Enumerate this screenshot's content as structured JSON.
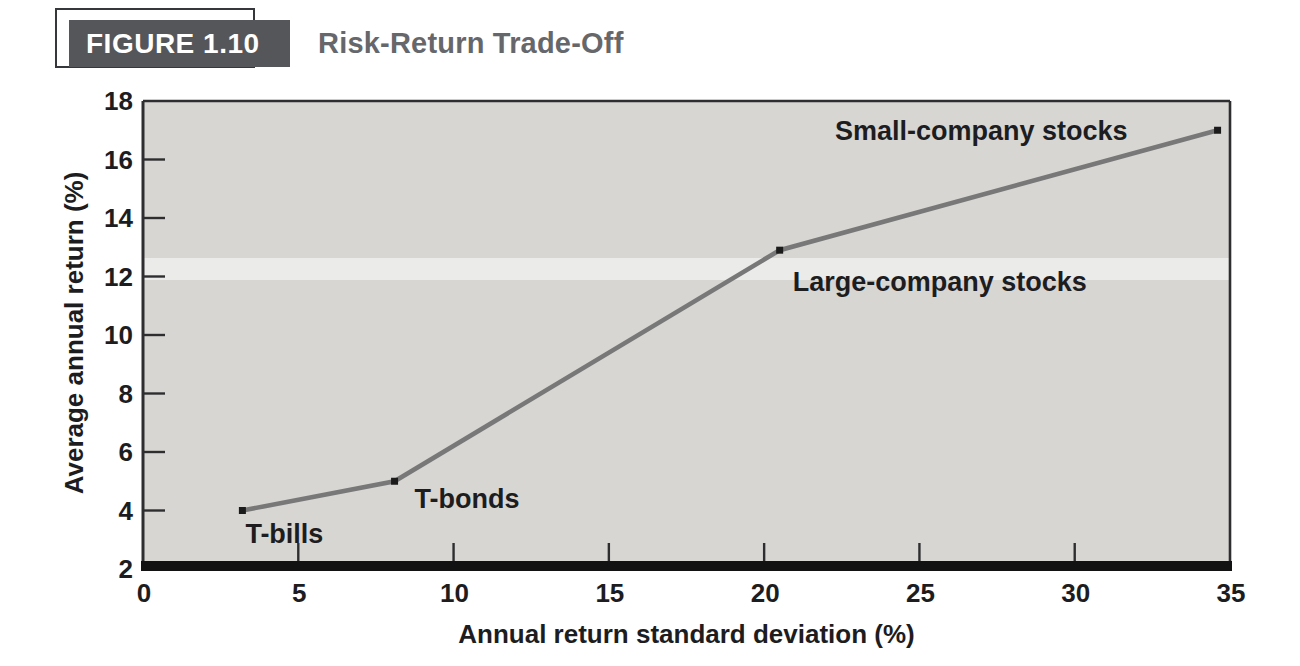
{
  "header": {
    "figure_label": "FIGURE 1.10",
    "title": "Risk-Return Trade-Off"
  },
  "chart_data": {
    "type": "line",
    "title": "Risk-Return Trade-Off",
    "xlabel": "Annual return standard deviation (%)",
    "ylabel": "Average annual return (%)",
    "xlim": [
      0,
      35
    ],
    "ylim": [
      2,
      18
    ],
    "x_ticks": [
      0,
      5,
      10,
      15,
      20,
      25,
      30,
      35
    ],
    "y_ticks": [
      2,
      4,
      6,
      8,
      10,
      12,
      14,
      16,
      18
    ],
    "grid": false,
    "legend": "none",
    "series": [
      {
        "name": "risk-return-tradeoff",
        "points": [
          {
            "label": "T-bills",
            "x": 3.2,
            "y": 4.0,
            "label_anchor": "middle",
            "label_dx": 42,
            "label_dy": 32
          },
          {
            "label": "T-bonds",
            "x": 8.1,
            "y": 5.0,
            "label_anchor": "start",
            "label_dx": 20,
            "label_dy": 27
          },
          {
            "label": "Large-company stocks",
            "x": 20.5,
            "y": 12.9,
            "label_anchor": "start",
            "label_dx": 13,
            "label_dy": 41
          },
          {
            "label": "Small-company stocks",
            "x": 34.6,
            "y": 17.0,
            "label_anchor": "end",
            "label_dx": -90,
            "label_dy": 10
          }
        ]
      }
    ],
    "colors": {
      "line": "#787878",
      "marker": "#1b1b1b",
      "plot_bg": "#d7d6d3",
      "axis": "#2e2e30",
      "axis_thick": "#121212",
      "text": "#1d1d1f",
      "badge_bg": "#55565a",
      "title_text": "#66676a"
    }
  }
}
